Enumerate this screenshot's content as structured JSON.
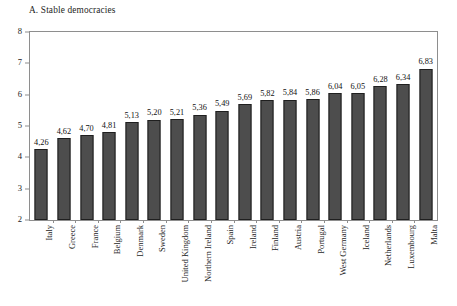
{
  "chart_data": {
    "type": "bar",
    "title": "A. Stable democracies",
    "xlabel": "",
    "ylabel": "",
    "ylim": [
      2,
      8
    ],
    "yticks": [
      2,
      3,
      4,
      5,
      6,
      7,
      8
    ],
    "ytick_labels": [
      "2",
      "3",
      "4",
      "5",
      "6",
      "7",
      "8"
    ],
    "grid": false,
    "legend": null,
    "decimal_separator": ",",
    "categories": [
      "Italy",
      "Greece",
      "France",
      "Belgium",
      "Denmark",
      "Sweden",
      "United Kingdom",
      "Northern Ireland",
      "Spain",
      "Ireland",
      "Finland",
      "Austria",
      "Portugal",
      "West Germany",
      "Iceland",
      "Netherlands",
      "Luxembourg",
      "Malta"
    ],
    "values": [
      4.26,
      4.62,
      4.7,
      4.81,
      5.13,
      5.2,
      5.21,
      5.36,
      5.49,
      5.69,
      5.82,
      5.84,
      5.86,
      6.04,
      6.05,
      6.28,
      6.34,
      6.83
    ],
    "value_labels": [
      "4,26",
      "4,62",
      "4,70",
      "4,81",
      "5,13",
      "5,20",
      "5,21",
      "5,36",
      "5,49",
      "5,69",
      "5,82",
      "5,84",
      "5,86",
      "6,04",
      "6,05",
      "6,28",
      "6,34",
      "6,83"
    ],
    "bar_color": "#4d4d4d",
    "bar_edge_color": "#1f1f1f",
    "axis_color": "#8e8e8e",
    "background_color": "#ffffff"
  }
}
